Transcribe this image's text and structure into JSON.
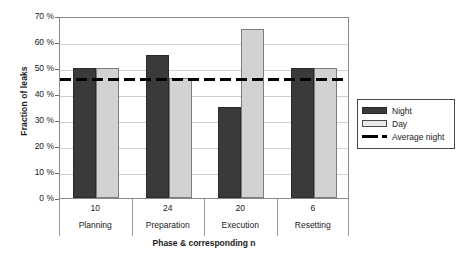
{
  "chart_data": {
    "type": "bar",
    "title": "",
    "xlabel": "Phase & corresponding n",
    "ylabel": "Fraction of leaks",
    "categories": [
      "Planning",
      "Preparation",
      "Execution",
      "Resetting"
    ],
    "category_n": [
      "10",
      "24",
      "20",
      "6"
    ],
    "series": [
      {
        "name": "Night",
        "values": [
          50,
          55,
          35,
          50
        ],
        "color": "#3a3a3a"
      },
      {
        "name": "Day",
        "values": [
          50,
          46,
          65,
          50
        ],
        "color": "#d2d2d2"
      }
    ],
    "reference_line": {
      "name": "Average night",
      "value": 46.5,
      "style": "dashed",
      "color": "#000000"
    },
    "ylim": [
      0,
      70
    ],
    "ytick_values": [
      0,
      10,
      20,
      30,
      40,
      50,
      60,
      70
    ],
    "ytick_labels": [
      "0 %",
      "10 %",
      "20 %",
      "30 %",
      "40 %",
      "50 %",
      "60 %",
      "70 %"
    ],
    "grid": true,
    "grid_axis": "y",
    "legend_position": "right",
    "legend_entries": [
      "Night",
      "Day",
      "Average night"
    ]
  }
}
